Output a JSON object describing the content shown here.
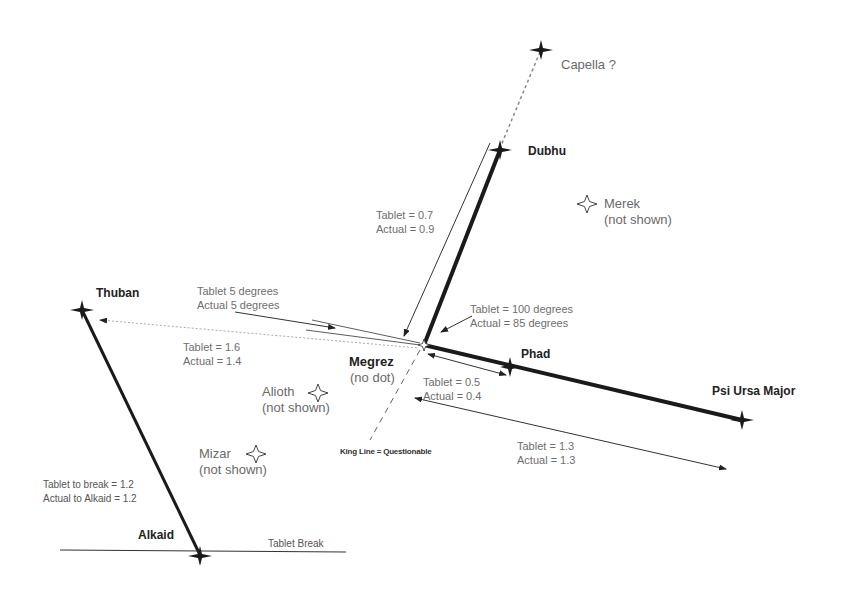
{
  "stars": {
    "capella": {
      "name": "Capella ?"
    },
    "dubhu": {
      "name": "Dubhu"
    },
    "merek": {
      "name": "Merek",
      "note": "(not shown)"
    },
    "thuban": {
      "name": "Thuban"
    },
    "megrez": {
      "name": "Megrez",
      "note": "(no dot)"
    },
    "phad": {
      "name": "Phad"
    },
    "psi": {
      "name": "Psi Ursa Major"
    },
    "alioth": {
      "name": "Alioth",
      "note": "(not shown)"
    },
    "mizar": {
      "name": "Mizar",
      "note": "(not shown)"
    },
    "alkaid": {
      "name": "Alkaid"
    }
  },
  "measurements": {
    "dubhu_megrez": {
      "tablet": "Tablet = 0.7",
      "actual": "Actual = 0.9"
    },
    "angle_5": {
      "tablet": "Tablet 5 degrees",
      "actual": "Actual 5 degrees"
    },
    "angle_100": {
      "tablet": "Tablet = 100 degrees",
      "actual": "Actual = 85 degrees"
    },
    "thuban_megrez": {
      "tablet": "Tablet = 1.6",
      "actual": "Actual = 1.4"
    },
    "megrez_phad": {
      "tablet": "Tablet = 0.5",
      "actual": "Actual = 0.4"
    },
    "megrez_psi": {
      "tablet": "Tablet = 1.3",
      "actual": "Actual = 1.3"
    },
    "thuban_alkaid": {
      "tablet": "Tablet to break = 1.2",
      "actual": "Actual to Alkaid = 1.2"
    }
  },
  "annotations": {
    "king_line": "King Line = Questionable",
    "tablet_break": "Tablet Break"
  },
  "colors": {
    "line": "#1a1a1a",
    "dotted": "#888888",
    "text": "#6e6e6e"
  }
}
